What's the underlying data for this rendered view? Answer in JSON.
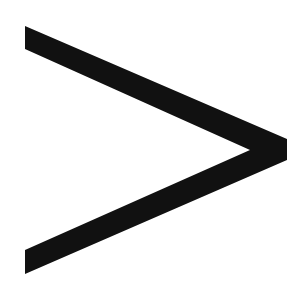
{
  "symbol": {
    "name": "greater-than",
    "glyph": ">",
    "color": "#111111",
    "background": "#ffffff"
  }
}
